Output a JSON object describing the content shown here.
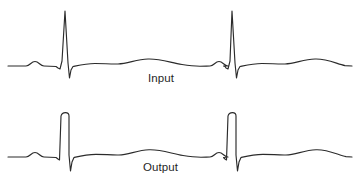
{
  "figure": {
    "name": "ecg-input-output-comparison",
    "background_color": "#ffffff",
    "width": 353,
    "height": 182
  },
  "panels": [
    {
      "id": "input",
      "label": "Input",
      "label_x": 148,
      "label_y": 73,
      "trace_color": "#2b2b2b",
      "stroke_width": 1.15,
      "r_wave_shape": "sharp-peak"
    },
    {
      "id": "output",
      "label": "Output",
      "label_x": 143,
      "label_y": 162,
      "trace_color": "#2b2b2b",
      "stroke_width": 1.15,
      "r_wave_shape": "flat-top-clipped"
    }
  ],
  "chart_data": {
    "type": "line",
    "title": "",
    "subtitle": "",
    "xlabel": "",
    "ylabel": "",
    "grid": false,
    "legend_position": "inline-below-trace",
    "axis_visible": false,
    "tick_labels": [],
    "annotations": [
      "Input",
      "Output"
    ],
    "signal_description": "Two single-lead ECG rhythm strips, each showing two cardiac beats (P wave, QRS complex, T wave). The Input trace has tall sharply pointed R waves; the Output trace has R waves with flattened, clipped tops at a lower amplitude.",
    "x": [
      0,
      353
    ],
    "series": [
      {
        "name": "Input",
        "baseline_y": 66,
        "r_peak_y": 11,
        "s_trough_y": 78,
        "beat_x_positions": [
          65,
          232
        ],
        "points": "M 8 66 L 26 66 C 30 66 31 61.5 35 61.5 C 39 61.5 40 66 44 66 L 56 66.5 L 58 68 L 60 69 L 62 61 L 65 11 L 68 63 L 69.5 78 L 71 70 L 73 66.5 C 80 65 86 63.5 95 63.5 C 104 63.5 110 64.2 118 64 C 128 63.7 136 59.5 148 59 C 160 58.5 170 62.5 182 64.5 C 190 65.8 196 66.2 200 66.2 C 205 66.2 207 66 210 66 C 214 66 215 61.5 219 61.5 C 223 61.5 224 66 228 66 L 223.5 66 L 225 66.5 L 226 68 L 228 69 L 230 61 L 232 11 L 235 63 L 236.5 78 L 238 70 L 240 66.5 C 247 65 253 63.5 262 63.5 C 271 63.5 277 64.2 285 64 C 295 63.7 303 59.5 315 59 C 327 58.5 337 64 345 65.6 L 352 66"
      },
      {
        "name": "Output",
        "baseline_y": 66,
        "r_peak_y": 22,
        "s_trough_y": 80,
        "beat_x_positions": [
          64,
          231
        ],
        "points": "M 8 66 L 26 66 C 30 66 31 61.5 35 61.5 C 39 61.5 40 66 44 66 L 56 66.5 L 58 68 L 59.5 69 L 61 25 C 61.6 22.3 63 21.6 65.5 21.6 C 68 21.6 69 22.6 69 25 L 69 64 L 70.5 80 L 72 71 L 74 66.5 C 81 64.8 87 63.3 96 63.3 C 105 63.3 111 64.2 119 64 C 129 63.6 137 59.3 149 58.8 C 161 58.3 171 62.5 183 64.5 C 191 65.8 197 66.2 201 66.2 C 205 66.2 207 66 210 66 C 214 66 215 61.5 219 61.5 C 223 61.5 224 66 228 66 L 223.5 66.5 L 225 68 L 226.5 69 L 228 25 C 228.6 22.3 230 21.6 232.5 21.6 C 235 21.6 236 22.6 236 25 L 236 64 L 237.5 80 L 239 71 L 241 66.5 C 248 64.8 254 63.3 263 63.3 C 272 63.3 278 64.2 286 64 C 296 63.6 304 59.3 316 58.8 C 328 58.3 338 64 346 65.6 L 352 66"
      }
    ]
  }
}
